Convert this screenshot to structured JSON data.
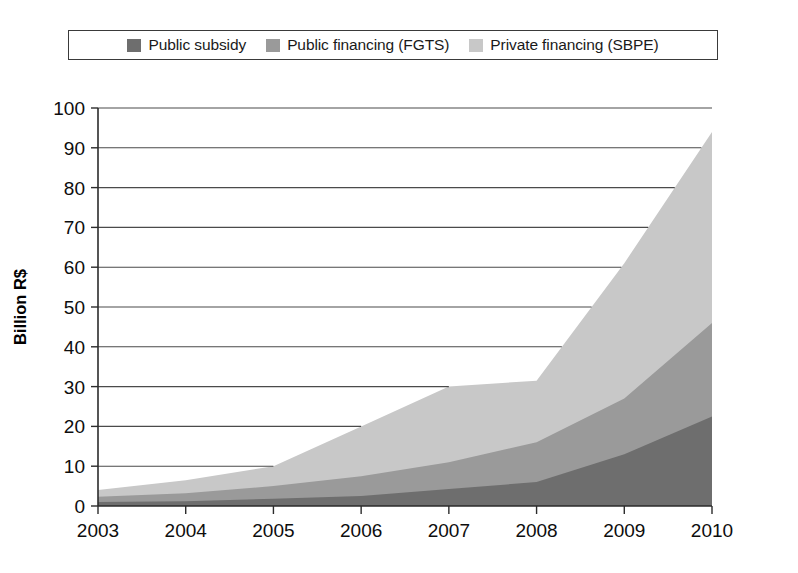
{
  "figure": {
    "background_color": "#ffffff",
    "style": "scanned-grayscale"
  },
  "legend": {
    "position": "top",
    "border_color": "#3a3a3a",
    "entries": [
      {
        "label": "Public subsidy",
        "color": "#6e6e6e",
        "swatch_name": "legend-swatch-public-subsidy"
      },
      {
        "label": "Public financing (FGTS)",
        "color": "#9a9a9a",
        "swatch_name": "legend-swatch-public-financing"
      },
      {
        "label": "Private financing (SBPE)",
        "color": "#c8c8c8",
        "swatch_name": "legend-swatch-private-financing"
      }
    ]
  },
  "chart_data": {
    "type": "area",
    "stacked": true,
    "title": "",
    "xlabel": "",
    "ylabel": "Billion R$",
    "categories": [
      "2003",
      "2004",
      "2005",
      "2006",
      "2007",
      "2008",
      "2009",
      "2010"
    ],
    "x": [
      2003,
      2004,
      2005,
      2006,
      2007,
      2008,
      2009,
      2010
    ],
    "xlim": [
      2003,
      2010
    ],
    "ylim": [
      0,
      100
    ],
    "ytick_labels": [
      "0",
      "10",
      "20",
      "30",
      "40",
      "50",
      "60",
      "70",
      "80",
      "90",
      "100"
    ],
    "yticks": [
      0,
      10,
      20,
      30,
      40,
      50,
      60,
      70,
      80,
      90,
      100
    ],
    "xtick_labels": [
      "2003",
      "2004",
      "2005",
      "2006",
      "2007",
      "2008",
      "2009",
      "2010"
    ],
    "grid": "horizontal",
    "legend_position": "top",
    "series": [
      {
        "name": "Public subsidy",
        "color": "#6e6e6e",
        "values": [
          1.0,
          1.2,
          1.8,
          2.5,
          4.3,
          6.0,
          13.0,
          22.5
        ]
      },
      {
        "name": "Public financing (FGTS)",
        "color": "#9a9a9a",
        "values": [
          1.3,
          2.0,
          3.2,
          5.0,
          6.7,
          10.0,
          14.0,
          23.5
        ]
      },
      {
        "name": "Private financing (SBPE)",
        "color": "#c8c8c8",
        "values": [
          1.7,
          3.3,
          5.0,
          12.5,
          19.0,
          15.5,
          34.0,
          48.0
        ]
      }
    ],
    "stacked_totals": [
      4.0,
      6.5,
      10.0,
      20.0,
      30.0,
      31.5,
      61.0,
      94.0
    ]
  }
}
